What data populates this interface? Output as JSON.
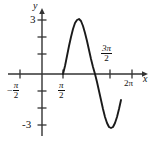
{
  "figure": {
    "kind": "cartesian-graph",
    "background": "#ffffff",
    "curve_color": "#1a1a1a",
    "axis_color": "#333333"
  },
  "axes": {
    "x_axis_label": "x",
    "y_axis_label": "y",
    "x_ticks": [
      {
        "label_nu": "π",
        "label_de": "2",
        "negative": true,
        "text": "-π/2",
        "x_px": 20
      },
      {
        "label_nu": "π",
        "label_de": "2",
        "negative": false,
        "text": "π/2",
        "x_px": 63
      },
      {
        "label_nu": "3π",
        "label_de": "2",
        "negative": false,
        "text": "3π/2",
        "x_px": 110
      },
      {
        "label_nu": "2π",
        "label_de": "",
        "negative": false,
        "text": "2π",
        "x_px": 132
      }
    ],
    "y_ticks": [
      {
        "text": "3",
        "y_px": 20
      },
      {
        "text": "-3",
        "y_px": 125
      }
    ],
    "origin_px": {
      "x": 42,
      "y": 74
    },
    "x_range_label": "-π/2 to 2π",
    "y_range_label": "-3 to 3"
  },
  "labels": {
    "y_axis": "y",
    "x_axis": "x",
    "top_value": "3",
    "bottom_value": "-3",
    "neg_half_pi_numerator": "π",
    "neg_half_pi_denominator": "2",
    "neg_sign": "−",
    "half_pi_numerator": "π",
    "half_pi_denominator": "2",
    "three_half_pi_numerator": "3π",
    "three_half_pi_denominator": "2",
    "two_pi": "2π"
  },
  "chart_data": {
    "type": "line",
    "title": "",
    "xlabel": "x",
    "ylabel": "y",
    "xlim": [
      -1.5707963,
      6.2831853
    ],
    "ylim": [
      -3,
      3
    ],
    "grid": false,
    "legend": null,
    "xtick_labels": [
      "-π/2",
      "π/2",
      "3π/2",
      "2π"
    ],
    "xtick_values": [
      -1.5707963,
      1.5707963,
      4.712389,
      6.2831853
    ],
    "ytick_labels": [
      "3",
      "-3"
    ],
    "ytick_values": [
      3,
      -3
    ],
    "series": [
      {
        "name": "y = -3 sin(2x) on [π/2, 3π/2]",
        "domain": [
          1.5707963,
          4.712389
        ],
        "amplitude": 3,
        "period": 3.1415927,
        "points_px": [
          [
            63,
            74
          ],
          [
            65,
            66
          ],
          [
            67,
            56
          ],
          [
            69,
            46
          ],
          [
            71,
            37
          ],
          [
            73,
            29
          ],
          [
            75,
            23
          ],
          [
            77,
            20
          ],
          [
            79,
            19
          ],
          [
            81,
            21
          ],
          [
            83,
            26
          ],
          [
            85,
            33
          ],
          [
            87,
            41
          ],
          [
            89,
            50
          ],
          [
            91,
            59
          ],
          [
            93,
            67
          ],
          [
            95,
            74
          ],
          [
            97,
            82
          ],
          [
            99,
            91
          ],
          [
            101,
            100
          ],
          [
            103,
            109
          ],
          [
            105,
            117
          ],
          [
            107,
            123
          ],
          [
            109,
            127
          ],
          [
            111,
            128
          ],
          [
            113,
            127
          ],
          [
            115,
            123
          ],
          [
            117,
            117
          ],
          [
            119,
            109
          ],
          [
            121,
            100
          ]
        ],
        "values": [
          {
            "x": 1.5707963,
            "y": 0
          },
          {
            "x": 1.9634954,
            "y": 2.121
          },
          {
            "x": 2.3561945,
            "y": 3.0
          },
          {
            "x": 2.7488936,
            "y": 2.121
          },
          {
            "x": 3.1415927,
            "y": 0
          },
          {
            "x": 3.5342917,
            "y": -2.121
          },
          {
            "x": 3.9269908,
            "y": -3.0
          },
          {
            "x": 4.3196899,
            "y": -2.121
          },
          {
            "x": 4.712389,
            "y": 0
          }
        ]
      }
    ]
  }
}
